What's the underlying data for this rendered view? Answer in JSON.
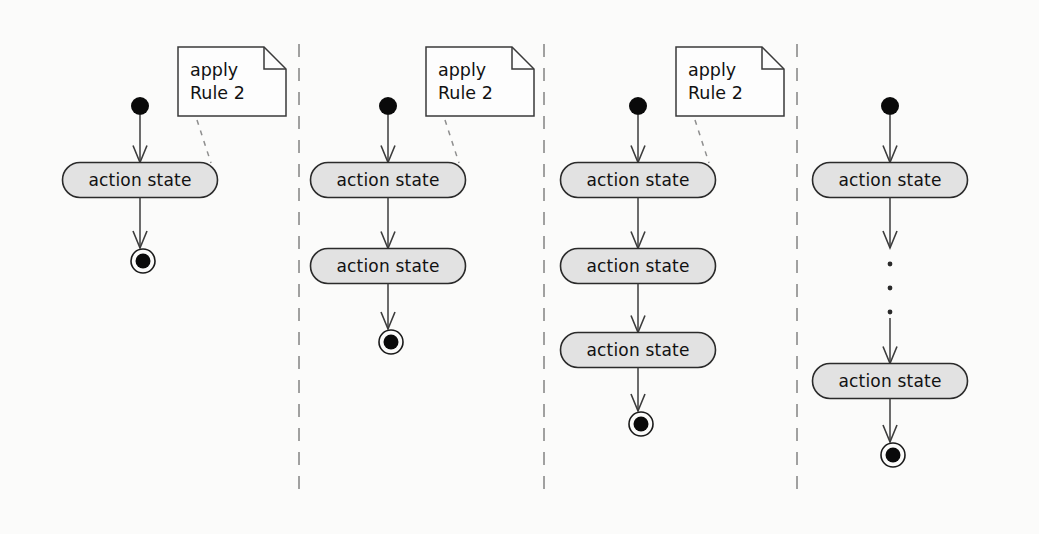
{
  "diagram": {
    "type": "uml-activity-diagram",
    "title": "",
    "background_color": "#fbfbfa",
    "state_fill_color": "#e2e2e2",
    "state_stroke_color": "#2b2b2b",
    "note_fill_color": "#fdfdfd",
    "divider_color": "#8a8a8a",
    "labels": {
      "action_state": "action state",
      "note_line_1": "apply",
      "note_line_2": "Rule 2",
      "ellipsis": "⋮"
    },
    "panels": [
      {
        "index": 1,
        "center_x": 140,
        "has_note": true,
        "note": {
          "x": 178,
          "y": 47,
          "width": 108,
          "height": 69,
          "fold": 22,
          "line_1": "apply",
          "line_2": "Rule 2"
        },
        "initial_state": {
          "cx": 140,
          "cy": 106,
          "r": 9
        },
        "action_states": [
          {
            "label": "action state",
            "cx": 140,
            "cy": 180,
            "width": 155,
            "height": 35
          }
        ],
        "final_state": {
          "cx": 143,
          "cy": 261,
          "outer_r": 12,
          "inner_r": 7.5
        },
        "ellipsis": null,
        "anchor": {
          "x1": 197,
          "y1": 120,
          "x2": 211,
          "y2": 163
        }
      },
      {
        "index": 2,
        "center_x": 388,
        "has_note": true,
        "note": {
          "x": 426,
          "y": 47,
          "width": 108,
          "height": 69,
          "fold": 22,
          "line_1": "apply",
          "line_2": "Rule 2"
        },
        "initial_state": {
          "cx": 388,
          "cy": 106,
          "r": 9
        },
        "action_states": [
          {
            "label": "action state",
            "cx": 388,
            "cy": 180,
            "width": 155,
            "height": 35
          },
          {
            "label": "action state",
            "cx": 388,
            "cy": 266,
            "width": 155,
            "height": 35
          }
        ],
        "final_state": {
          "cx": 391,
          "cy": 342,
          "outer_r": 12,
          "inner_r": 7.5
        },
        "ellipsis": null,
        "anchor": {
          "x1": 445,
          "y1": 120,
          "x2": 459,
          "y2": 163
        }
      },
      {
        "index": 3,
        "center_x": 638,
        "has_note": true,
        "note": {
          "x": 676,
          "y": 47,
          "width": 108,
          "height": 69,
          "fold": 22,
          "line_1": "apply",
          "line_2": "Rule 2"
        },
        "initial_state": {
          "cx": 638,
          "cy": 106,
          "r": 9
        },
        "action_states": [
          {
            "label": "action state",
            "cx": 638,
            "cy": 180,
            "width": 155,
            "height": 35
          },
          {
            "label": "action state",
            "cx": 638,
            "cy": 266,
            "width": 155,
            "height": 35
          },
          {
            "label": "action state",
            "cx": 638,
            "cy": 350,
            "width": 155,
            "height": 35
          }
        ],
        "final_state": {
          "cx": 641,
          "cy": 424,
          "outer_r": 12,
          "inner_r": 7.5
        },
        "ellipsis": null,
        "anchor": {
          "x1": 695,
          "y1": 120,
          "x2": 709,
          "y2": 163
        }
      },
      {
        "index": 4,
        "center_x": 890,
        "has_note": false,
        "note": null,
        "initial_state": {
          "cx": 890,
          "cy": 106,
          "r": 9
        },
        "action_states": [
          {
            "label": "action state",
            "cx": 890,
            "cy": 180,
            "width": 155,
            "height": 35
          },
          {
            "label": "action state",
            "cx": 890,
            "cy": 381,
            "width": 155,
            "height": 35
          }
        ],
        "final_state": {
          "cx": 893,
          "cy": 455,
          "outer_r": 12,
          "inner_r": 7.5
        },
        "ellipsis": {
          "cx": 890,
          "dots_y": [
            264,
            288,
            312
          ],
          "r": 2.4
        },
        "anchor": null
      }
    ],
    "dividers": [
      {
        "x": 299,
        "y1": 44,
        "y2": 492
      },
      {
        "x": 544,
        "y1": 44,
        "y2": 492
      },
      {
        "x": 797,
        "y1": 44,
        "y2": 492
      }
    ]
  }
}
